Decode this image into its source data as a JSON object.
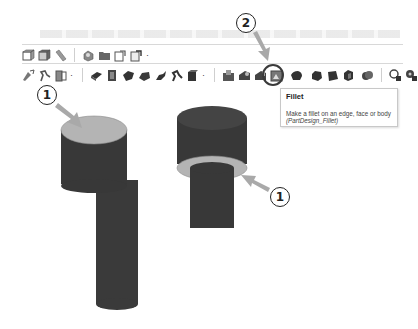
{
  "toolbar_row1": {
    "items": [
      {
        "name": "view-front-icon"
      },
      {
        "name": "view-top-icon"
      },
      {
        "name": "measure-icon"
      },
      {
        "name": "separator"
      },
      {
        "name": "create-part-icon"
      },
      {
        "name": "create-group-icon"
      },
      {
        "name": "create-link-icon"
      },
      {
        "name": "create-variant-link-icon",
        "dropdown": true
      }
    ]
  },
  "toolbar_row2": {
    "items": [
      {
        "name": "sketch-attach-icon"
      },
      {
        "name": "validate-sketch-icon"
      },
      {
        "name": "shape-binder-icon",
        "dropdown": true
      },
      {
        "name": "separator"
      },
      {
        "name": "pad-icon"
      },
      {
        "name": "revolution-icon"
      },
      {
        "name": "additive-loft-icon"
      },
      {
        "name": "additive-pipe-icon"
      },
      {
        "name": "additive-helix-icon"
      },
      {
        "name": "additive-primitive-icon"
      },
      {
        "name": "additive-box-icon",
        "dropdown": true
      },
      {
        "name": "separator"
      },
      {
        "name": "pocket-icon"
      },
      {
        "name": "hole-icon"
      },
      {
        "name": "groove-icon"
      },
      {
        "name": "subtractive-loft-icon"
      },
      {
        "name": "fillet-icon",
        "highlighted": true
      },
      {
        "name": "chamfer-icon"
      },
      {
        "name": "draft-icon"
      },
      {
        "name": "thickness-icon"
      },
      {
        "name": "boolean-icon"
      },
      {
        "name": "separator"
      },
      {
        "name": "mirrored-icon"
      },
      {
        "name": "linear-pattern-icon"
      }
    ]
  },
  "tooltip": {
    "title": "Fillet",
    "description": "Make a fillet on an edge, face or body",
    "command": "(PartDesign_Fillet)"
  },
  "callouts": [
    {
      "id": "callout-1-left",
      "label": "1"
    },
    {
      "id": "callout-2",
      "label": "2"
    },
    {
      "id": "callout-1-right",
      "label": "1"
    }
  ],
  "colors": {
    "solid": "#3a3a3a",
    "selected_face": "#b4b4b4",
    "arrow": "#a9a9a9",
    "callout_border": "#222222"
  }
}
